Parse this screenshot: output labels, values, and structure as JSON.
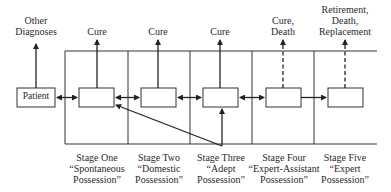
{
  "diagram": {
    "start_node": "Patient",
    "outcomes": [
      {
        "id": "patient",
        "label_lines": [
          "Other",
          "Diagnoses"
        ],
        "style": "solid"
      },
      {
        "id": "stage1",
        "label_lines": [
          "Cure"
        ],
        "style": "solid"
      },
      {
        "id": "stage2",
        "label_lines": [
          "Cure"
        ],
        "style": "solid"
      },
      {
        "id": "stage3",
        "label_lines": [
          "Cure"
        ],
        "style": "solid"
      },
      {
        "id": "stage4",
        "label_lines": [
          "Cure,",
          "Death"
        ],
        "style": "dashed"
      },
      {
        "id": "stage5",
        "label_lines": [
          "Retirement,",
          "Death,",
          "Replacement"
        ],
        "style": "dashed"
      }
    ],
    "stages": [
      {
        "id": "stage1",
        "lines": [
          "Stage One",
          "“Spontaneous",
          "Possession”"
        ]
      },
      {
        "id": "stage2",
        "lines": [
          "Stage Two",
          "“Domestic",
          "Possession”"
        ]
      },
      {
        "id": "stage3",
        "lines": [
          "Stage Three",
          "“Adept",
          "Possession”"
        ]
      },
      {
        "id": "stage4",
        "lines": [
          "Stage Four",
          "“Expert-Assistant",
          "Possession”"
        ]
      },
      {
        "id": "stage5",
        "lines": [
          "Stage Five",
          "“Expert",
          "Possession”"
        ]
      }
    ],
    "connections": [
      {
        "from": "patient",
        "to": "stage1",
        "type": "bidirectional"
      },
      {
        "from": "stage1",
        "to": "stage2",
        "type": "bidirectional"
      },
      {
        "from": "stage2",
        "to": "stage3",
        "type": "bidirectional"
      },
      {
        "from": "stage3",
        "to": "stage4",
        "type": "bidirectional"
      },
      {
        "from": "stage4",
        "to": "stage5",
        "type": "forward"
      },
      {
        "from": "stage3-external",
        "to": "stage1",
        "type": "forward"
      },
      {
        "from": "stage3-external",
        "to": "stage3",
        "type": "forward"
      }
    ]
  }
}
